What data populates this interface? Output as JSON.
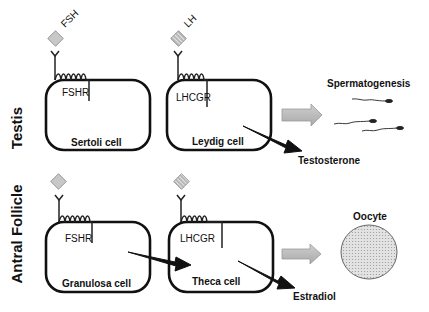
{
  "rows": [
    {
      "side_label": "Testis",
      "cells": [
        {
          "hormone": "FSH",
          "receptor": "FSHR",
          "cell_name": "Sertoli cell",
          "hormone_pattern": "solid"
        },
        {
          "hormone": "LH",
          "receptor": "LHCGR",
          "cell_name": "Leydig cell",
          "hormone_pattern": "striped"
        }
      ],
      "product": "Testosterone",
      "outcome": "Spermatogenesis"
    },
    {
      "side_label": "Antral Follicle",
      "cells": [
        {
          "hormone": "",
          "receptor": "FSHR",
          "cell_name": "Granulosa cell",
          "hormone_pattern": "solid"
        },
        {
          "hormone": "",
          "receptor": "LHCGR",
          "cell_name": "Theca cell",
          "hormone_pattern": "striped"
        }
      ],
      "product": "Estradiol",
      "outcome": "Oocyte"
    }
  ],
  "colors": {
    "line": "#111111",
    "hormone_fill": "#c8c8c8",
    "arrow_fill": "#b8b8b8",
    "oocyte_fill": "#dcdcdc"
  }
}
